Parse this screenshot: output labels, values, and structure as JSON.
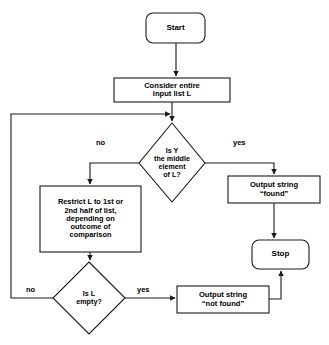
{
  "figure": {
    "type": "flowchart",
    "caption_partial": ""
  },
  "nodes": {
    "start": {
      "label": "Start",
      "shape": "rounded-rectangle"
    },
    "consider": {
      "label": "Consider entire\ninput list L",
      "shape": "rectangle"
    },
    "decision_middle": {
      "label": "Is Y\nthe middle\nelement\nof L?",
      "shape": "diamond"
    },
    "restrict": {
      "label": "Restrict L to 1st or\n2nd half of list,\ndepending on\noutcome of\ncomparison",
      "shape": "rectangle"
    },
    "decision_empty": {
      "label": "Is L\nempty?",
      "shape": "diamond"
    },
    "output_found": {
      "label": "Output string\n“found”",
      "shape": "rectangle"
    },
    "output_not_found": {
      "label": "Output string\n“not found”",
      "shape": "rectangle"
    },
    "stop": {
      "label": "Stop",
      "shape": "rounded-rectangle"
    }
  },
  "edge_labels": {
    "middle_no": "no",
    "middle_yes": "yes",
    "empty_no": "no",
    "empty_yes": "yes"
  },
  "colors": {
    "stroke": "#1a1a1a",
    "text": "#000000",
    "background": "#ffffff"
  }
}
